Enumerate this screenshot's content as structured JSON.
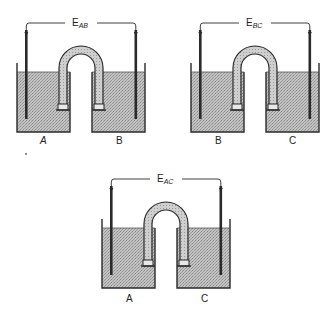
{
  "figure": {
    "cells": [
      {
        "id": "cell-AB",
        "emf_label": "E",
        "emf_subscript": "AB",
        "left_label": "A",
        "right_label": "B",
        "left_label_italic": true,
        "right_label_italic": false
      },
      {
        "id": "cell-BC",
        "emf_label": "E",
        "emf_subscript": "BC",
        "left_label": "B",
        "right_label": "C",
        "left_label_italic": false,
        "right_label_italic": false
      },
      {
        "id": "cell-AC",
        "emf_label": "E",
        "emf_subscript": "AC",
        "left_label": "A",
        "right_label": "C",
        "left_label_italic": false,
        "right_label_italic": false
      }
    ],
    "colors": {
      "solution_fill": "#b8b8b8",
      "outline": "#2a2a2a",
      "bridge_fill": "#c4c4c4",
      "background": "#ffffff"
    }
  }
}
